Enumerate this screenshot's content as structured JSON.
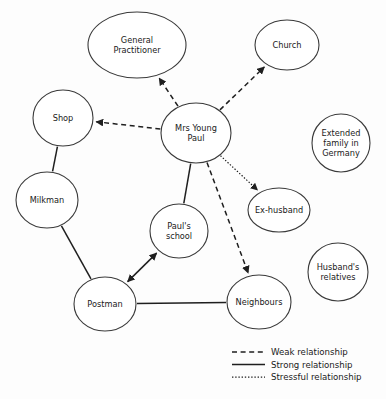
{
  "diagram": {
    "type": "social-network-ecomap",
    "title": "",
    "background_color": "#fdfdfd",
    "line_color": "#1f1f1f",
    "node_fill": "#ffffff",
    "node_stroke": "#3a3a3a",
    "nodes": [
      {
        "id": "gp",
        "label": "General\nPractitioner",
        "cx": 137,
        "cy": 45,
        "rx": 49,
        "ry": 33
      },
      {
        "id": "church",
        "label": "Church",
        "cx": 287,
        "cy": 45,
        "rx": 32,
        "ry": 25
      },
      {
        "id": "shop",
        "label": "Shop",
        "cx": 63,
        "cy": 118,
        "rx": 30,
        "ry": 28
      },
      {
        "id": "center",
        "label": "Mrs Young\nPaul",
        "cx": 196,
        "cy": 133,
        "rx": 35,
        "ry": 30
      },
      {
        "id": "extended",
        "label": "Extended\nfamily in\nGermany",
        "cx": 341,
        "cy": 143,
        "rx": 29,
        "ry": 29
      },
      {
        "id": "milkman",
        "label": "Milkman",
        "cx": 47,
        "cy": 200,
        "rx": 31,
        "ry": 28
      },
      {
        "id": "exhusband",
        "label": "Ex-husband",
        "cx": 279,
        "cy": 210,
        "rx": 31,
        "ry": 22
      },
      {
        "id": "school",
        "label": "Paul's\nschool",
        "cx": 179,
        "cy": 231,
        "rx": 29,
        "ry": 27
      },
      {
        "id": "relatives",
        "label": "Husband's\nrelatives",
        "cx": 338,
        "cy": 272,
        "rx": 30,
        "ry": 29
      },
      {
        "id": "postman",
        "label": "Postman",
        "cx": 105,
        "cy": 304,
        "rx": 31,
        "ry": 27
      },
      {
        "id": "neighbours",
        "label": "Neighbours",
        "cx": 259,
        "cy": 302,
        "rx": 32,
        "ry": 27
      }
    ],
    "edges": [
      {
        "from": "center",
        "to": "gp",
        "type": "weak",
        "arrow": "to"
      },
      {
        "from": "center",
        "to": "church",
        "type": "weak",
        "arrow": "to"
      },
      {
        "from": "center",
        "to": "shop",
        "type": "weak",
        "arrow": "to"
      },
      {
        "from": "center",
        "to": "exhusband",
        "type": "stressful",
        "arrow": "to"
      },
      {
        "from": "center",
        "to": "neighbours",
        "type": "weak",
        "arrow": "to"
      },
      {
        "from": "center",
        "to": "school",
        "type": "strong",
        "arrow": "none"
      },
      {
        "from": "shop",
        "to": "milkman",
        "type": "strong",
        "arrow": "none"
      },
      {
        "from": "milkman",
        "to": "postman",
        "type": "strong",
        "arrow": "none"
      },
      {
        "from": "postman",
        "to": "school",
        "type": "strong",
        "arrow": "both"
      },
      {
        "from": "postman",
        "to": "neighbours",
        "type": "strong",
        "arrow": "none"
      }
    ],
    "isolated_nodes": [
      "extended",
      "relatives"
    ]
  },
  "legend": {
    "x": 232,
    "y": 352,
    "items": [
      {
        "key": "weak",
        "label": "Weak relationship",
        "style": "dashed"
      },
      {
        "key": "strong",
        "label": "Strong relationship",
        "style": "solid"
      },
      {
        "key": "stressful",
        "label": "Stressful relationship",
        "style": "dotted"
      }
    ]
  }
}
